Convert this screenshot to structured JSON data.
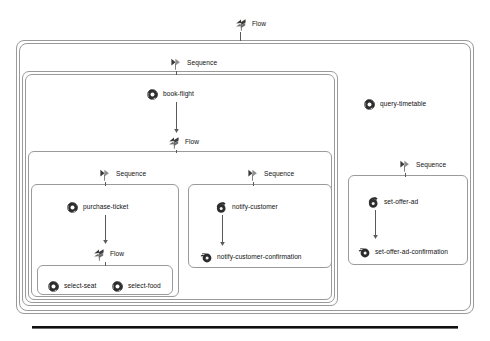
{
  "diagram": {
    "bottom_rule": true,
    "nodes": [
      {
        "id": "flow-root",
        "label": "Flow",
        "icon": "flow-icon",
        "x": 232,
        "y": 16
      },
      {
        "id": "sequence-main",
        "label": "Sequence",
        "icon": "sequence-icon",
        "x": 167,
        "y": 55
      },
      {
        "id": "book-flight",
        "label": "book-flight",
        "icon": "invoke-icon",
        "x": 143,
        "y": 86
      },
      {
        "id": "flow-inner",
        "label": "Flow",
        "icon": "flow-icon",
        "x": 165,
        "y": 134
      },
      {
        "id": "sequence-left",
        "label": "Sequence",
        "icon": "sequence-icon",
        "x": 96,
        "y": 166
      },
      {
        "id": "sequence-right",
        "label": "Sequence",
        "icon": "sequence-icon",
        "x": 244,
        "y": 166
      },
      {
        "id": "purchase-ticket",
        "label": "purchase-ticket",
        "icon": "invoke-icon",
        "x": 63,
        "y": 199
      },
      {
        "id": "notify-customer",
        "label": "notify-customer",
        "icon": "reply-icon",
        "x": 212,
        "y": 199
      },
      {
        "id": "flow-left",
        "label": "Flow",
        "icon": "flow-icon",
        "x": 90,
        "y": 246
      },
      {
        "id": "notify-confirmation",
        "label": "notify-customer-confirmation",
        "icon": "receive-icon",
        "x": 197,
        "y": 249
      },
      {
        "id": "select-seat",
        "label": "select-seat",
        "icon": "invoke-icon",
        "x": 44,
        "y": 278
      },
      {
        "id": "select-food",
        "label": "select-food",
        "icon": "invoke-icon",
        "x": 108,
        "y": 278
      },
      {
        "id": "query-timetable",
        "label": "query-timetable",
        "icon": "invoke-icon",
        "x": 360,
        "y": 96
      },
      {
        "id": "sequence-offer",
        "label": "Sequence",
        "icon": "sequence-icon",
        "x": 396,
        "y": 157
      },
      {
        "id": "set-offer-ad",
        "label": "set-offer-ad",
        "icon": "reply-icon",
        "x": 364,
        "y": 194
      },
      {
        "id": "offer-confirmation",
        "label": "set-offer-ad-confirmation",
        "icon": "receive-icon",
        "x": 355,
        "y": 244
      }
    ],
    "containers": [
      {
        "id": "outer-scope",
        "level": 0,
        "x": 16,
        "y": 40,
        "w": 458,
        "h": 274
      },
      {
        "id": "outer-scope-b",
        "level": 0,
        "x": 19,
        "y": 43,
        "w": 452,
        "h": 268
      },
      {
        "id": "sequence-scope",
        "level": 1,
        "x": 22,
        "y": 71,
        "w": 316,
        "h": 235
      },
      {
        "id": "sequence-scope-b",
        "level": 1,
        "x": 25,
        "y": 74,
        "w": 310,
        "h": 229
      },
      {
        "id": "flow-scope",
        "level": 2,
        "x": 28,
        "y": 151,
        "w": 304,
        "h": 149
      },
      {
        "id": "left-seq-scope",
        "level": 3,
        "x": 31,
        "y": 184,
        "w": 148,
        "h": 113
      },
      {
        "id": "right-seq-scope",
        "level": 3,
        "x": 188,
        "y": 184,
        "w": 144,
        "h": 84
      },
      {
        "id": "select-flow-box",
        "level": 3,
        "x": 37,
        "y": 265,
        "w": 136,
        "h": 30
      },
      {
        "id": "offer-seq-scope",
        "level": 3,
        "x": 348,
        "y": 175,
        "w": 120,
        "h": 90
      }
    ],
    "connectors": [
      {
        "id": "c-flow-root-down",
        "x": 240,
        "y": 30,
        "h": 11
      },
      {
        "id": "c-seq-main-down",
        "x": 176,
        "y": 69,
        "h": 6
      },
      {
        "id": "c-bookflight-down",
        "x": 176,
        "y": 99,
        "h": 34,
        "arrow": true
      },
      {
        "id": "c-flow-inner-down",
        "x": 176,
        "y": 148,
        "h": 5
      },
      {
        "id": "c-seq-left-down",
        "x": 105,
        "y": 180,
        "h": 6
      },
      {
        "id": "c-seq-right-down",
        "x": 253,
        "y": 180,
        "h": 6
      },
      {
        "id": "c-purchase-down",
        "x": 105,
        "y": 212,
        "h": 32,
        "arrow": true
      },
      {
        "id": "c-notify-down",
        "x": 222,
        "y": 212,
        "h": 34,
        "arrow": true
      },
      {
        "id": "c-flow-left-down",
        "x": 105,
        "y": 260,
        "h": 6
      },
      {
        "id": "c-seq-offer-down",
        "x": 405,
        "y": 171,
        "h": 6
      },
      {
        "id": "c-offer-down",
        "x": 375,
        "y": 207,
        "h": 32,
        "arrow": true
      }
    ]
  },
  "colors": {
    "border": "#9a9a9a",
    "connector": "#5a5a5a",
    "text": "#111111",
    "background": "#ffffff",
    "rule": "#111111"
  },
  "icon_names": {
    "flow-icon": "flow-icon",
    "sequence-icon": "sequence-icon",
    "invoke-icon": "invoke-icon",
    "reply-icon": "reply-icon",
    "receive-icon": "receive-icon"
  }
}
